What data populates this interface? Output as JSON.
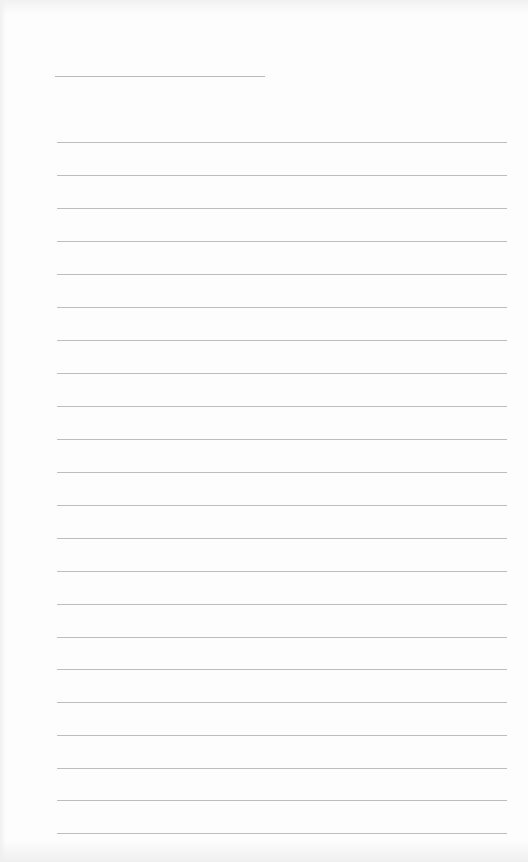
{
  "document": {
    "type": "lined-paper",
    "header": {
      "line_label": "",
      "line_value": ""
    },
    "ruled_lines": [
      {
        "top": 142,
        "text": ""
      },
      {
        "top": 175,
        "text": ""
      },
      {
        "top": 208,
        "text": ""
      },
      {
        "top": 241,
        "text": ""
      },
      {
        "top": 274,
        "text": ""
      },
      {
        "top": 307,
        "text": ""
      },
      {
        "top": 340,
        "text": ""
      },
      {
        "top": 373,
        "text": ""
      },
      {
        "top": 406,
        "text": ""
      },
      {
        "top": 439,
        "text": ""
      },
      {
        "top": 472,
        "text": ""
      },
      {
        "top": 505,
        "text": ""
      },
      {
        "top": 538,
        "text": ""
      },
      {
        "top": 571,
        "text": ""
      },
      {
        "top": 604,
        "text": ""
      },
      {
        "top": 637,
        "text": ""
      },
      {
        "top": 669,
        "text": ""
      },
      {
        "top": 702,
        "text": ""
      },
      {
        "top": 735,
        "text": ""
      },
      {
        "top": 768,
        "text": ""
      },
      {
        "top": 800,
        "text": ""
      },
      {
        "top": 833,
        "text": ""
      }
    ],
    "colors": {
      "paper": "#fdfdfd",
      "rule": "#bdbdbd"
    }
  }
}
